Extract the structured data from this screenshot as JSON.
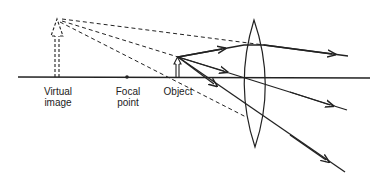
{
  "diagram": {
    "type": "ray-diagram",
    "colors": {
      "background": "#ffffff",
      "ink": "#222222"
    },
    "labels": {
      "virtual_image": "Virtual\nimage",
      "focal_point": "Focal\npoint",
      "object": "Object"
    },
    "elements": {
      "optical_axis": "solid horizontal line",
      "lens": "biconvex lens",
      "object_arrow": "solid upright arrow",
      "virtual_image_arrow": "dashed upright arrow (enlarged)",
      "focal_point_marker": "dot on axis",
      "real_rays": 3,
      "extrapolated_rays": "dashed lines back to virtual image"
    }
  }
}
